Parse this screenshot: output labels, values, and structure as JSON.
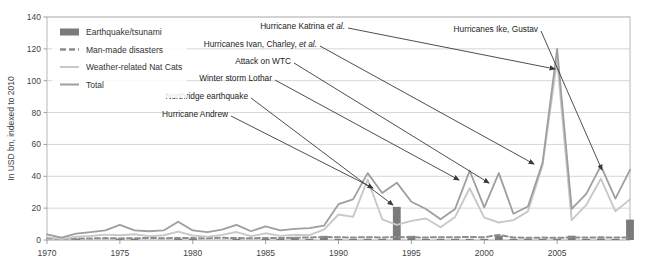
{
  "chart_data": {
    "type": "line",
    "title": "",
    "xlabel": "",
    "ylabel": "In USD bn, indexed to 2010",
    "xlim": [
      1970,
      2010
    ],
    "ylim": [
      0,
      140
    ],
    "ytick_step": 20,
    "yticks": [
      0,
      20,
      40,
      60,
      80,
      100,
      120,
      140
    ],
    "xticks": [
      1970,
      1975,
      1980,
      1985,
      1990,
      1995,
      2000,
      2005
    ],
    "grid": true,
    "legend_position": "top-left",
    "x": [
      1970,
      1971,
      1972,
      1973,
      1974,
      1975,
      1976,
      1977,
      1978,
      1979,
      1980,
      1981,
      1982,
      1983,
      1984,
      1985,
      1986,
      1987,
      1988,
      1989,
      1990,
      1991,
      1992,
      1993,
      1994,
      1995,
      1996,
      1997,
      1998,
      1999,
      2000,
      2001,
      2002,
      2003,
      2004,
      2005,
      2006,
      2007,
      2008,
      2009,
      2010
    ],
    "series": [
      {
        "name": "Earthquake/tsunami",
        "type": "bar",
        "color": "#7b7b7b",
        "values": [
          0,
          0.6,
          0.3,
          0,
          0,
          0.4,
          0.6,
          0,
          0,
          0.4,
          0.5,
          0,
          0,
          0.3,
          0,
          0.8,
          0.4,
          1.8,
          0.3,
          2.6,
          0.4,
          0.3,
          0.4,
          0.5,
          20.8,
          2.6,
          0.3,
          0.4,
          0.3,
          0.5,
          0.4,
          2.6,
          0.4,
          0.6,
          0.5,
          0.4,
          2.7,
          0.5,
          1.0,
          0.6,
          12.8
        ]
      },
      {
        "name": "Man-made disasters",
        "type": "line-dashed",
        "color": "#8d8d8d",
        "values": [
          1.1,
          0.6,
          0.9,
          1.0,
          1.2,
          1.0,
          1.1,
          1.3,
          1.1,
          1.3,
          1.2,
          1.1,
          1.4,
          1.2,
          1.1,
          1.3,
          1.2,
          1.4,
          1.6,
          1.9,
          1.7,
          1.6,
          1.8,
          1.6,
          1.9,
          1.7,
          1.6,
          1.8,
          1.7,
          1.9,
          1.7,
          3.2,
          1.6,
          1.4,
          1.5,
          1.4,
          1.6,
          1.5,
          1.7,
          1.5,
          1.6
        ]
      },
      {
        "name": "Weather-related Nat Cats",
        "type": "line",
        "color": "#c8c8c8",
        "values": [
          1.8,
          0.6,
          2.0,
          2.5,
          3.4,
          3.0,
          3.6,
          2.4,
          3.0,
          5.3,
          2.8,
          2.0,
          3.2,
          5.0,
          2.4,
          4.2,
          2.6,
          3.3,
          3.0,
          6.5,
          16.0,
          14.5,
          38.0,
          13.0,
          9.5,
          12.0,
          13.5,
          8.0,
          14.5,
          32.5,
          14.0,
          11.0,
          12.5,
          18.0,
          47.0,
          113.0,
          12.5,
          22.0,
          38.5,
          18.0,
          25.5
        ]
      },
      {
        "name": "Total",
        "type": "line",
        "color": "#9e9e9e",
        "values": [
          3.5,
          1.5,
          4.0,
          5.0,
          6.0,
          9.5,
          6.0,
          5.5,
          6.0,
          11.5,
          6.0,
          5.0,
          6.5,
          9.5,
          5.5,
          8.5,
          6.0,
          7.0,
          7.5,
          9.0,
          22.5,
          25.5,
          42.0,
          29.5,
          36.0,
          24.0,
          19.5,
          13.0,
          19.5,
          43.5,
          20.5,
          42.0,
          16.5,
          21.0,
          48.5,
          120.0,
          19.5,
          29.0,
          46.5,
          26.0,
          44.0
        ]
      }
    ],
    "annotations": [
      {
        "label": "Hurricane Andrew",
        "plain": "Hurricane Andrew",
        "italic": "",
        "label_x": 228,
        "label_y": 114,
        "tip_x": 373,
        "tip_y": 188
      },
      {
        "label": "Northridge earthquake",
        "plain": "Northridge earthquake",
        "italic": "",
        "label_x": 248,
        "label_y": 96,
        "tip_x": 393,
        "tip_y": 205
      },
      {
        "label": "Winter storm Lothar",
        "plain": "Winter storm Lothar",
        "italic": "",
        "label_x": 272,
        "label_y": 78,
        "tip_x": 459,
        "tip_y": 180
      },
      {
        "label": "Attack on WTC",
        "plain": "Attack on WTC",
        "italic": "",
        "label_x": 291,
        "label_y": 61,
        "tip_x": 489,
        "tip_y": 183
      },
      {
        "label": "Hurricanes Ivan, Charley, et al.",
        "plain": "Hurricanes Ivan, Charley, ",
        "italic": "et al.",
        "label_x": 317,
        "label_y": 44,
        "tip_x": 534,
        "tip_y": 164
      },
      {
        "label": "Hurricane Katrina et al.",
        "plain": "Hurricane Katrina ",
        "italic": "et al.",
        "label_x": 345,
        "label_y": 26,
        "tip_x": 555,
        "tip_y": 69
      },
      {
        "label": "Hurricanes Ike, Gustav",
        "plain": "Hurricanes Ike, Gustav",
        "italic": "",
        "label_x": 538,
        "label_y": 29,
        "tip_x": 602,
        "tip_y": 170
      }
    ]
  },
  "legend": {
    "items": [
      {
        "label": "Earthquake/tsunami",
        "marker": "bar-swatch",
        "color": "#7b7b7b"
      },
      {
        "label": "Man-made disasters",
        "marker": "dashed-line-swatch",
        "color": "#8d8d8d"
      },
      {
        "label": "Weather-related Nat Cats",
        "marker": "light-line-swatch",
        "color": "#c8c8c8"
      },
      {
        "label": "Total",
        "marker": "line-swatch",
        "color": "#9e9e9e"
      }
    ]
  },
  "axes": {
    "y_label": "In USD bn, indexed to 2010",
    "y_tick_labels": [
      "0",
      "20",
      "40",
      "60",
      "80",
      "100",
      "120",
      "140"
    ],
    "x_tick_labels": [
      "1970",
      "1975",
      "1980",
      "1985",
      "1990",
      "1995",
      "2000",
      "2005"
    ]
  }
}
